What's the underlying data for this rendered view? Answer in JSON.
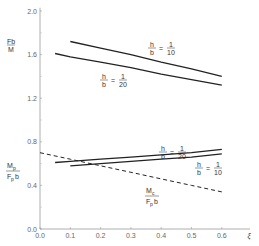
{
  "chart_data": {
    "type": "line",
    "title": "",
    "xlabel": "ξ",
    "ylabel_top": "Fb/M",
    "ylabel_bottom": "Mp/(Fp b)",
    "xlim": [
      0.0,
      0.65
    ],
    "ylim": [
      0.0,
      2.0
    ],
    "x_ticks": [
      "0.0",
      "0.1",
      "0.2",
      "0.3",
      "0.4",
      "0.5",
      "0.6"
    ],
    "y_ticks": [
      "0.0",
      "0.4",
      "0.8",
      "1.2",
      "1.6",
      "2.0"
    ],
    "grid": false,
    "legend": "inline annotations",
    "series": [
      {
        "name": "Fb/M, h/b = 1/10",
        "style": "solid",
        "x": [
          0.1,
          0.2,
          0.3,
          0.4,
          0.5,
          0.6
        ],
        "y": [
          1.72,
          1.66,
          1.6,
          1.53,
          1.47,
          1.4
        ]
      },
      {
        "name": "Fb/M, h/b = 1/20",
        "style": "solid",
        "x": [
          0.05,
          0.1,
          0.2,
          0.3,
          0.4,
          0.5,
          0.6
        ],
        "y": [
          1.61,
          1.58,
          1.53,
          1.48,
          1.42,
          1.37,
          1.32
        ]
      },
      {
        "name": "Mp/(Fp b), h/b = 1/20",
        "style": "solid",
        "x": [
          0.05,
          0.1,
          0.2,
          0.3,
          0.4,
          0.5,
          0.6
        ],
        "y": [
          0.61,
          0.62,
          0.64,
          0.66,
          0.68,
          0.7,
          0.73
        ]
      },
      {
        "name": "Mp/(Fp b), h/b = 1/10",
        "style": "solid",
        "x": [
          0.1,
          0.2,
          0.3,
          0.4,
          0.5,
          0.6
        ],
        "y": [
          0.58,
          0.6,
          0.62,
          0.64,
          0.66,
          0.69
        ]
      },
      {
        "name": "Mc/(Fp b)",
        "style": "dashed",
        "x": [
          0.0,
          0.1,
          0.2,
          0.3,
          0.4,
          0.5,
          0.6
        ],
        "y": [
          0.7,
          0.64,
          0.58,
          0.52,
          0.46,
          0.4,
          0.34
        ]
      }
    ],
    "annotations": [
      {
        "text": "h/b = 1/10",
        "near": "upper curve 1/10"
      },
      {
        "text": "h/b = 1/20",
        "near": "upper curve 1/20"
      },
      {
        "text": "h/b = 1/20",
        "near": "lower curve 1/20"
      },
      {
        "text": "h/b = 1/10",
        "near": "lower curve 1/10"
      },
      {
        "text": "Mc/(Fp b)",
        "near": "dashed curve"
      }
    ]
  },
  "labels": {
    "fb": "Fb",
    "m": "M",
    "mp_num": "M",
    "mp_sub": "p",
    "fpb_f": "F",
    "fpb_sub": "p",
    "fpb_b": "b",
    "mc_num": "M",
    "mc_sub": "c",
    "h": "h",
    "b": "b",
    "eq": "=",
    "one": "1",
    "ten": "10",
    "twenty": "20",
    "xi": "ξ"
  }
}
